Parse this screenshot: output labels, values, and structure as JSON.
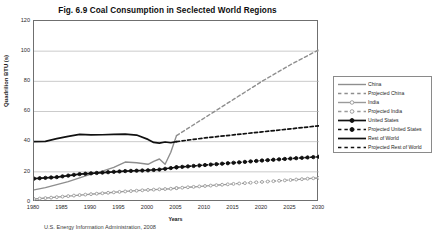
{
  "figure": {
    "title": "Fig. 6.9  Coal Consumption in Seclected World Regions",
    "source": "U.S. Energy Information Administration,  2008"
  },
  "axes": {
    "ylabel": "Quadrilion BTU (s)",
    "xlabel": "Years",
    "yticks": [
      "0",
      "20",
      "40",
      "60",
      "80",
      "100",
      "120"
    ],
    "xticks": [
      "1980",
      "1985",
      "1990",
      "1995",
      "2000",
      "2005",
      "2010",
      "2015",
      "2020",
      "2025",
      "2030"
    ]
  },
  "legend": {
    "items": [
      {
        "label": "China",
        "style": "solid-gray",
        "color": "#8e8e8e"
      },
      {
        "label": "Projected China",
        "style": "dashed-gray",
        "color": "#8e8e8e"
      },
      {
        "label": "India",
        "style": "solid-gray-marker",
        "color": "#9a9a9a"
      },
      {
        "label": "Projected India",
        "style": "dashed-gray-marker",
        "color": "#9a9a9a"
      },
      {
        "label": "United States",
        "style": "solid-black-marker",
        "color": "#111111"
      },
      {
        "label": "Projected United States",
        "style": "dashed-black-marker",
        "color": "#111111"
      },
      {
        "label": "Rest of World",
        "style": "solid-black",
        "color": "#111111"
      },
      {
        "label": "Projected Rest of World",
        "style": "dashed-black",
        "color": "#111111"
      }
    ]
  },
  "chart_data": {
    "type": "line",
    "title": "Fig. 6.9  Coal Consumption in Seclected World Regions",
    "xlabel": "Years",
    "ylabel": "Quadrilion BTU (s)",
    "xlim": [
      1980,
      2030
    ],
    "ylim": [
      0,
      120
    ],
    "ytick_step": 20,
    "xtick_step": 5,
    "grid": "horizontal",
    "legend_position": "right-outside",
    "source": "U.S. Energy Information Administration,  2008",
    "series": [
      {
        "name": "China",
        "kind": "historical",
        "color": "#8e8e8e",
        "dash": false,
        "marker": false,
        "x": [
          1980,
          1982,
          1984,
          1986,
          1988,
          1990,
          1992,
          1994,
          1996,
          1998,
          2000,
          2001,
          2002,
          2003,
          2004,
          2005
        ],
        "y": [
          8.0,
          9.5,
          11.5,
          13.5,
          16.0,
          18.5,
          20.5,
          23.0,
          26.5,
          26.0,
          25.0,
          27.0,
          28.5,
          25.0,
          33.0,
          44.0
        ]
      },
      {
        "name": "Projected China",
        "kind": "projected",
        "color": "#8e8e8e",
        "dash": true,
        "marker": false,
        "x": [
          2005,
          2010,
          2015,
          2020,
          2025,
          2030
        ],
        "y": [
          44.0,
          56.0,
          68.0,
          80.0,
          91.0,
          101.0
        ]
      },
      {
        "name": "India",
        "kind": "historical",
        "color": "#9a9a9a",
        "dash": false,
        "marker": true,
        "x": [
          1980,
          1984,
          1988,
          1992,
          1996,
          2000,
          2002,
          2004,
          2005
        ],
        "y": [
          2.0,
          3.2,
          4.6,
          5.8,
          7.0,
          8.0,
          8.4,
          8.8,
          9.2
        ]
      },
      {
        "name": "Projected India",
        "kind": "projected",
        "color": "#9a9a9a",
        "dash": true,
        "marker": true,
        "x": [
          2005,
          2010,
          2015,
          2020,
          2025,
          2030
        ],
        "y": [
          9.2,
          10.6,
          12.0,
          13.3,
          14.6,
          16.0
        ]
      },
      {
        "name": "United States",
        "kind": "historical",
        "color": "#111111",
        "dash": false,
        "marker": false,
        "x": [
          1980,
          1982,
          1984,
          1986,
          1988,
          1990,
          1992,
          1994,
          1996,
          1998,
          2000,
          2001,
          2002,
          2003,
          2004,
          2005
        ],
        "y": [
          40.0,
          40.2,
          42.0,
          43.5,
          44.8,
          44.5,
          44.6,
          44.8,
          45.0,
          44.4,
          41.5,
          39.5,
          39.0,
          39.8,
          39.3,
          40.0
        ]
      },
      {
        "name": "Projected United States",
        "kind": "projected",
        "color": "#111111",
        "dash": true,
        "marker": false,
        "x": [
          2005,
          2010,
          2015,
          2020,
          2025,
          2030
        ],
        "y": [
          40.0,
          42.5,
          44.5,
          46.5,
          48.5,
          50.5
        ]
      },
      {
        "name": "Rest of World",
        "kind": "historical",
        "color": "#111111",
        "dash": false,
        "marker": true,
        "x": [
          1980,
          1984,
          1988,
          1992,
          1996,
          2000,
          2002,
          2004,
          2005
        ],
        "y": [
          15.5,
          16.5,
          18.5,
          19.5,
          20.5,
          21.0,
          21.5,
          22.5,
          23.0
        ]
      },
      {
        "name": "Projected Rest of World",
        "kind": "projected",
        "color": "#111111",
        "dash": true,
        "marker": true,
        "x": [
          2005,
          2010,
          2015,
          2020,
          2025,
          2030
        ],
        "y": [
          23.0,
          24.5,
          26.0,
          27.5,
          28.8,
          30.0
        ]
      }
    ]
  }
}
